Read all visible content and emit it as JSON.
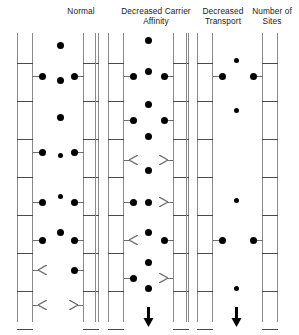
{
  "figure": {
    "type": "diagram",
    "background_color": "#ffffff",
    "ink_color": "#000000",
    "membrane_color": "#8a8a8a",
    "rung_color": "#4a4a4a"
  },
  "headers": [
    {
      "id": "normal",
      "label": "Normal"
    },
    {
      "id": "affinity",
      "label": "Decreased Carrier\nAffinity"
    },
    {
      "id": "transport",
      "label": "Decreased\nTransport"
    },
    {
      "id": "sites",
      "label": "Number of\nSites"
    }
  ],
  "legend": {
    "loaded_carrier": "filled circle",
    "empty_carrier": "open chevron arrowhead",
    "net_flux_arrow": "downward arrow"
  },
  "panels": [
    {
      "id": "panel-normal",
      "title": "Normal",
      "membranes": [
        {
          "id": "normal-left-membrane",
          "x": 17,
          "width": 16,
          "rungs": 8
        },
        {
          "id": "normal-right-membrane",
          "x": 83,
          "width": 16,
          "rungs": 8
        }
      ],
      "free_solute_count": 4,
      "carriers_left": [
        {
          "y": 76,
          "state": "loaded"
        },
        {
          "y": 152,
          "state": "loaded"
        },
        {
          "y": 202,
          "state": "loaded"
        },
        {
          "y": 240,
          "state": "loaded"
        },
        {
          "y": 270,
          "state": "empty"
        },
        {
          "y": 305,
          "state": "empty"
        }
      ],
      "carriers_right": [
        {
          "y": 76,
          "state": "loaded"
        },
        {
          "y": 152,
          "state": "loaded"
        },
        {
          "y": 202,
          "state": "loaded"
        },
        {
          "y": 240,
          "state": "loaded"
        },
        {
          "y": 270,
          "state": "loaded"
        },
        {
          "y": 305,
          "state": "empty"
        }
      ],
      "flux_arrow": false
    },
    {
      "id": "panel-affinity",
      "title": "Decreased Carrier Affinity",
      "membranes": [
        {
          "id": "affinity-left-membrane",
          "x": 108,
          "width": 16,
          "rungs": 8
        },
        {
          "id": "affinity-right-membrane",
          "x": 173,
          "width": 16,
          "rungs": 8
        }
      ],
      "free_solute_count": 7,
      "carriers_left": [
        {
          "y": 76,
          "state": "loaded"
        },
        {
          "y": 120,
          "state": "loaded"
        },
        {
          "y": 160,
          "state": "empty"
        },
        {
          "y": 202,
          "state": "loaded"
        },
        {
          "y": 240,
          "state": "empty"
        },
        {
          "y": 278,
          "state": "loaded"
        }
      ],
      "carriers_right": [
        {
          "y": 76,
          "state": "loaded"
        },
        {
          "y": 120,
          "state": "loaded"
        },
        {
          "y": 160,
          "state": "empty"
        },
        {
          "y": 202,
          "state": "empty"
        },
        {
          "y": 240,
          "state": "loaded"
        },
        {
          "y": 278,
          "state": "empty"
        }
      ],
      "flux_arrow": true,
      "flux_arrow_x": 148
    },
    {
      "id": "panel-sites",
      "title": "Decreased Number of Transport Sites",
      "membranes": [
        {
          "id": "sites-left-membrane",
          "x": 197,
          "width": 16,
          "rungs": 8
        },
        {
          "id": "sites-right-membrane",
          "x": 262,
          "width": 16,
          "rungs": 8
        }
      ],
      "free_solute_count": 4,
      "carriers_left": [
        {
          "y": 76,
          "state": "loaded"
        },
        {
          "y": 240,
          "state": "loaded"
        }
      ],
      "carriers_right": [
        {
          "y": 76,
          "state": "loaded"
        },
        {
          "y": 240,
          "state": "loaded"
        }
      ],
      "flux_arrow": true,
      "flux_arrow_x": 236
    }
  ],
  "extra_rails": [
    {
      "id": "rail-a",
      "x": 95
    },
    {
      "id": "rail-b",
      "x": 186
    }
  ],
  "free_solutes": [
    {
      "x": 60,
      "y": 45,
      "size": "lg"
    },
    {
      "x": 60,
      "y": 80,
      "size": "lg"
    },
    {
      "x": 60,
      "y": 117,
      "size": "lg"
    },
    {
      "x": 60,
      "y": 155,
      "size": "sm"
    },
    {
      "x": 60,
      "y": 196,
      "size": "sm"
    },
    {
      "x": 60,
      "y": 232,
      "size": "lg"
    },
    {
      "x": 148,
      "y": 40,
      "size": "lg"
    },
    {
      "x": 148,
      "y": 71,
      "size": "lg"
    },
    {
      "x": 148,
      "y": 104,
      "size": "lg"
    },
    {
      "x": 148,
      "y": 136,
      "size": "lg"
    },
    {
      "x": 148,
      "y": 170,
      "size": "lg"
    },
    {
      "x": 148,
      "y": 202,
      "size": "lg"
    },
    {
      "x": 148,
      "y": 232,
      "size": "lg"
    },
    {
      "x": 148,
      "y": 262,
      "size": "lg"
    },
    {
      "x": 148,
      "y": 288,
      "size": "lg"
    },
    {
      "x": 236,
      "y": 60,
      "size": "sm"
    },
    {
      "x": 236,
      "y": 110,
      "size": "sm"
    },
    {
      "x": 236,
      "y": 200,
      "size": "sm"
    },
    {
      "x": 236,
      "y": 288,
      "size": "sm"
    }
  ]
}
